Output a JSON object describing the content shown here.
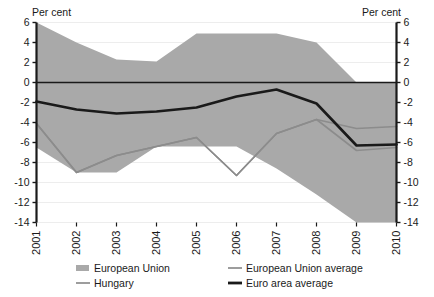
{
  "chart_data": {
    "type": "area",
    "title": "",
    "xlabel": "",
    "ylabel": "Per cent",
    "ylabel_right": "Per cent",
    "categories": [
      "2001",
      "2002",
      "2003",
      "2004",
      "2005",
      "2006",
      "2007",
      "2008",
      "2009",
      "2010"
    ],
    "x": [
      2001,
      2002,
      2003,
      2004,
      2005,
      2006,
      2007,
      2008,
      2009,
      2010
    ],
    "ylim": [
      -14,
      6
    ],
    "yticks": [
      6,
      4,
      2,
      0,
      -2,
      -4,
      -6,
      -8,
      -10,
      -12,
      -14
    ],
    "ytick_labels": [
      "6",
      "4",
      "2",
      "0",
      "-2",
      "-4",
      "-6",
      "-8",
      "-10",
      "-12",
      "-14"
    ],
    "grid": true,
    "legend_position": "bottom",
    "zero_line": 0,
    "band": {
      "name": "European Union",
      "type": "range-band",
      "color": "#a9a9a9",
      "upper": [
        6.0,
        4.0,
        2.3,
        2.1,
        4.9,
        4.9,
        4.9,
        4.0,
        0.0,
        0.0
      ],
      "lower": [
        -6.5,
        -9.0,
        -9.0,
        -6.4,
        -6.4,
        -6.4,
        -8.6,
        -11.2,
        -14.6,
        -15.2
      ]
    },
    "series": [
      {
        "name": "European Union average",
        "color": "#8c8c8c",
        "width": 1.6,
        "values": [
          -4.1,
          -9.0,
          -7.3,
          -6.4,
          -5.5,
          -9.3,
          -5.1,
          -3.7,
          -4.6,
          -4.4
        ]
      },
      {
        "name": "Hungary",
        "color": "#8c8c8c",
        "width": 1.6,
        "values": [
          -4.1,
          -9.0,
          -7.3,
          -6.4,
          -5.5,
          -9.3,
          -5.1,
          -3.7,
          -6.8,
          -6.5
        ]
      },
      {
        "name": "Euro area average",
        "color": "#1a1a1a",
        "width": 2.6,
        "values": [
          -1.9,
          -2.7,
          -3.1,
          -2.9,
          -2.5,
          -1.4,
          -0.7,
          -2.1,
          -6.3,
          -6.2
        ]
      }
    ],
    "legend": [
      {
        "label": "European Union",
        "marker": "swatch",
        "color": "#a9a9a9"
      },
      {
        "label": "European Union average",
        "marker": "line-thin",
        "color": "#8c8c8c"
      },
      {
        "label": "Hungary",
        "marker": "line-thin",
        "color": "#8c8c8c"
      },
      {
        "label": "Euro area average",
        "marker": "line-thick",
        "color": "#1a1a1a"
      }
    ]
  }
}
